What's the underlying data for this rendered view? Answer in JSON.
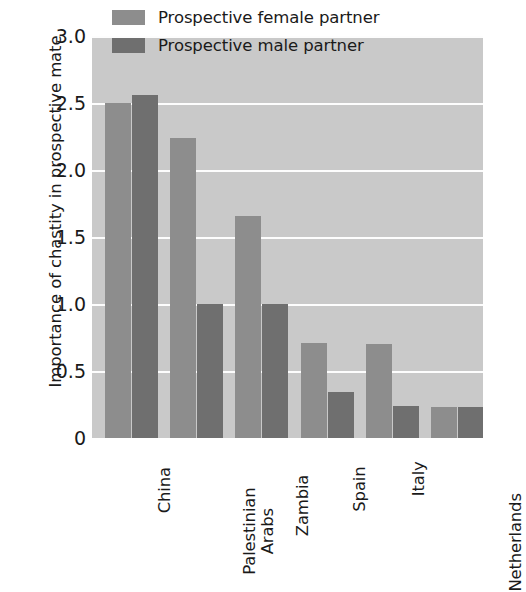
{
  "chart_data": {
    "type": "bar",
    "title": "",
    "subtitle": "",
    "xlabel": "",
    "ylabel": "Importance of chastity in prospective mate",
    "categories": [
      "China",
      "Palestinian Arabs",
      "Zambia",
      "Spain",
      "Italy",
      "Netherlands"
    ],
    "series": [
      {
        "name": "Prospective female partner",
        "color": "#8d8d8d",
        "values": [
          2.5,
          2.24,
          1.66,
          0.71,
          0.7,
          0.23
        ]
      },
      {
        "name": "Prospective male partner",
        "color": "#6f6f6f",
        "values": [
          2.56,
          1.0,
          1.0,
          0.34,
          0.24,
          0.23
        ]
      }
    ],
    "ylim": [
      0,
      3.0
    ],
    "yticks": [
      0,
      0.5,
      1.0,
      1.5,
      2.0,
      2.5,
      3.0
    ],
    "ytick_labels": [
      "0",
      "0.5",
      "1.0",
      "1.5",
      "2.0",
      "2.5",
      "3.0"
    ],
    "grid": true,
    "grid_axis": "y",
    "grid_color": "#fdfdfd",
    "legend_position": "top-center",
    "plot_background": "#c9c9c9",
    "figure_background": "#ffffff"
  },
  "ylabel": {
    "text": "Importance of chastity in prospective mate"
  },
  "yticks": [
    {
      "label": "3.0",
      "value": 3.0
    },
    {
      "label": "2.5",
      "value": 2.5
    },
    {
      "label": "2.0",
      "value": 2.0
    },
    {
      "label": "1.5",
      "value": 1.5
    },
    {
      "label": "1.0",
      "value": 1.0
    },
    {
      "label": "0.5",
      "value": 0.5
    },
    {
      "label": "0",
      "value": 0
    }
  ],
  "xticks": [
    {
      "label": "China",
      "line1": "China",
      "line2": ""
    },
    {
      "label": "Palestinian Arabs",
      "line1": "Palestinian",
      "line2": "Arabs"
    },
    {
      "label": "Zambia",
      "line1": "Zambia",
      "line2": ""
    },
    {
      "label": "Spain",
      "line1": "Spain",
      "line2": ""
    },
    {
      "label": "Italy",
      "line1": "Italy",
      "line2": ""
    },
    {
      "label": "Netherlands",
      "line1": "Netherlands",
      "line2": ""
    }
  ],
  "legend": {
    "entries": [
      {
        "label": "Prospective female partner",
        "color": "#8d8d8d"
      },
      {
        "label": "Prospective male partner",
        "color": "#6f6f6f"
      }
    ]
  }
}
